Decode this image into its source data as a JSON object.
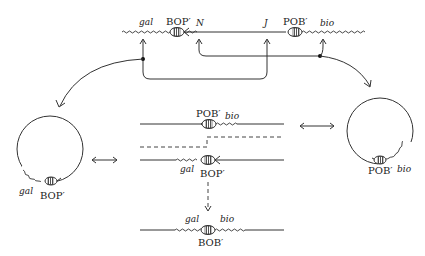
{
  "diagram": {
    "top_chromosome": {
      "labels": {
        "gal": "gal",
        "bop": "BOP′",
        "n": "N",
        "j": "J",
        "pob": "POB′",
        "bio": "bio"
      }
    },
    "left_circle": {
      "labels": {
        "gal": "gal",
        "bop": "BOP′"
      }
    },
    "right_circle": {
      "labels": {
        "pob": "POB′",
        "bio": "bio"
      }
    },
    "center_upper": {
      "labels": {
        "pob": "POB′",
        "bio": "bio"
      }
    },
    "center_lower": {
      "labels": {
        "gal": "gal",
        "bop": "BOP′"
      }
    },
    "bottom_product": {
      "labels": {
        "gal": "gal",
        "bio": "bio",
        "bob": "BOB′"
      }
    }
  }
}
